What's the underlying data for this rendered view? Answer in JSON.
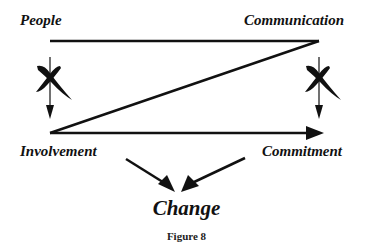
{
  "diagram": {
    "nodes": {
      "people": "People",
      "communication": "Communication",
      "involvement": "Involvement",
      "commitment": "Commitment",
      "change": "Change"
    },
    "edges": [
      {
        "from": "People",
        "to": "Communication",
        "type": "line"
      },
      {
        "from": "Communication",
        "to": "Involvement",
        "type": "line"
      },
      {
        "from": "Involvement",
        "to": "Commitment",
        "type": "arrow"
      },
      {
        "from": "People",
        "to": "Involvement",
        "type": "arrow",
        "crossed": true
      },
      {
        "from": "Communication",
        "to": "Commitment",
        "type": "arrow",
        "crossed": true
      },
      {
        "from": "Involvement",
        "to": "Change",
        "type": "arrow"
      },
      {
        "from": "Commitment",
        "to": "Change",
        "type": "arrow"
      }
    ],
    "caption": "Figure 8"
  }
}
